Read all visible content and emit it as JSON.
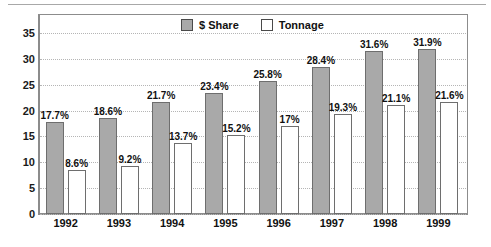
{
  "chart_data": {
    "type": "bar",
    "title": "",
    "subtitle": "",
    "xlabel": "",
    "ylabel": "",
    "ylim": [
      0,
      35
    ],
    "yticks": [
      "0",
      "5",
      "10",
      "15",
      "20",
      "25",
      "30",
      "35"
    ],
    "grid": true,
    "legend_position": "top-center",
    "categories": [
      "1992",
      "1993",
      "1994",
      "1995",
      "1996",
      "1997",
      "1998",
      "1999"
    ],
    "series": [
      {
        "name": "$ Share",
        "color": "#a9a9a9",
        "values": [
          17.7,
          18.6,
          21.7,
          23.4,
          25.8,
          28.4,
          31.6,
          31.9
        ],
        "labels": [
          "17.7%",
          "18.6%",
          "21.7%",
          "23.4%",
          "25.8%",
          "28.4%",
          "31.6%",
          "31.9%"
        ]
      },
      {
        "name": "Tonnage",
        "color": "#ffffff",
        "values": [
          8.6,
          9.2,
          13.7,
          15.2,
          17.0,
          19.3,
          21.1,
          21.6
        ],
        "labels": [
          "8.6%",
          "9.2%",
          "13.7%",
          "15.2%",
          "17%",
          "19.3%",
          "21.1%",
          "21.6%"
        ]
      }
    ]
  },
  "legend": {
    "items": [
      {
        "label": "$ Share",
        "swatch": "gray-filled-square"
      },
      {
        "label": "Tonnage",
        "swatch": "white-outlined-square"
      }
    ]
  },
  "colors": {
    "share_fill": "#a9a9a9",
    "tonnage_fill": "#ffffff",
    "bar_border": "#6e6e6e",
    "axis": "#8c8c8c",
    "grid": "#b5b5b5",
    "text": "#111111"
  }
}
